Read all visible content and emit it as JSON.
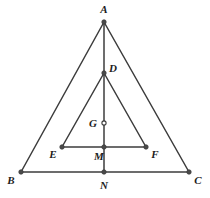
{
  "figure": {
    "type": "geometry-diagram",
    "canvas": {
      "width": 210,
      "height": 198
    },
    "background_color": "#ffffff",
    "line_color": "#3c3c3c",
    "label_color": "#1c1c1c",
    "points": [
      {
        "id": "A",
        "label": "A",
        "x": 104,
        "y": 22,
        "label_x": 104,
        "label_y": 9,
        "marker": "filled"
      },
      {
        "id": "B",
        "label": "B",
        "x": 21,
        "y": 172,
        "label_x": 11,
        "label_y": 180,
        "marker": "filled"
      },
      {
        "id": "C",
        "label": "C",
        "x": 189,
        "y": 172,
        "label_x": 198,
        "label_y": 180,
        "marker": "filled"
      },
      {
        "id": "D",
        "label": "D",
        "x": 104,
        "y": 73,
        "label_x": 113,
        "label_y": 68,
        "marker": "filled"
      },
      {
        "id": "E",
        "label": "E",
        "x": 62,
        "y": 147,
        "label_x": 53,
        "label_y": 154,
        "marker": "filled"
      },
      {
        "id": "F",
        "label": "F",
        "x": 146,
        "y": 147,
        "label_x": 155,
        "label_y": 154,
        "marker": "filled"
      },
      {
        "id": "G",
        "label": "G",
        "x": 104,
        "y": 123,
        "label_x": 93,
        "label_y": 123,
        "marker": "open"
      },
      {
        "id": "M",
        "label": "M",
        "x": 104,
        "y": 147,
        "label_x": 99,
        "label_y": 156,
        "marker": "filled"
      },
      {
        "id": "N",
        "label": "N",
        "x": 104,
        "y": 172,
        "label_x": 104,
        "label_y": 185,
        "marker": "filled"
      }
    ],
    "segments": [
      {
        "id": "AB",
        "from": "A",
        "to": "B",
        "x1": 104,
        "y1": 22,
        "x2": 21,
        "y2": 172
      },
      {
        "id": "AC",
        "from": "A",
        "to": "C",
        "x1": 104,
        "y1": 22,
        "x2": 189,
        "y2": 172
      },
      {
        "id": "BC",
        "from": "B",
        "to": "C",
        "x1": 21,
        "y1": 172,
        "x2": 189,
        "y2": 172
      },
      {
        "id": "AN",
        "from": "A",
        "to": "N",
        "x1": 104,
        "y1": 22,
        "x2": 104,
        "y2": 172
      },
      {
        "id": "DE",
        "from": "D",
        "to": "E",
        "x1": 104,
        "y1": 73,
        "x2": 62,
        "y2": 147
      },
      {
        "id": "DF",
        "from": "D",
        "to": "F",
        "x1": 104,
        "y1": 73,
        "x2": 146,
        "y2": 147
      },
      {
        "id": "EF",
        "from": "E",
        "to": "F",
        "x1": 62,
        "y1": 147,
        "x2": 146,
        "y2": 147
      }
    ]
  }
}
